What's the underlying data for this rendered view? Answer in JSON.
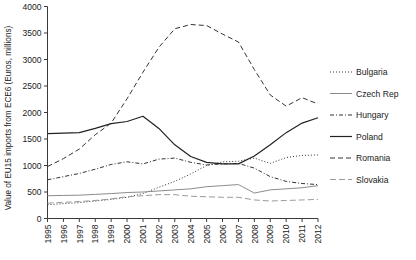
{
  "chart_data": {
    "type": "line",
    "title": "",
    "xlabel": "",
    "ylabel": "Value of EU15 imports from ECE6 (Euros, millions)",
    "x": [
      1995,
      1996,
      1997,
      1998,
      1999,
      2000,
      2001,
      2002,
      2003,
      2004,
      2005,
      2006,
      2007,
      2008,
      2009,
      2010,
      2011,
      2012
    ],
    "xtick_labels": [
      "1995",
      "1996",
      "1997",
      "1998",
      "1999",
      "2000",
      "2001",
      "2002",
      "2003",
      "2004",
      "2005",
      "2006",
      "2007",
      "2008",
      "2009",
      "2010",
      "2011",
      "2012"
    ],
    "ytick_labels": [
      "0",
      "500",
      "1000",
      "1500",
      "2000",
      "2500",
      "3000",
      "3500",
      "4000"
    ],
    "yticks": [
      0,
      500,
      1000,
      1500,
      2000,
      2500,
      3000,
      3500,
      4000
    ],
    "ylim": [
      0,
      4000
    ],
    "xlim": [
      1995,
      2012
    ],
    "grid": false,
    "legend_position": "right",
    "series": [
      {
        "name": "Bulgaria",
        "dash": "1,2",
        "width": 1.0,
        "color": "#333333",
        "values": [
          260,
          280,
          300,
          330,
          360,
          400,
          470,
          590,
          700,
          840,
          1000,
          1070,
          1080,
          1140,
          1040,
          1150,
          1190,
          1200
        ]
      },
      {
        "name": "Czech Rep",
        "dash": "none",
        "width": 1.0,
        "color": "#8c8c8c",
        "values": [
          430,
          435,
          440,
          455,
          470,
          490,
          500,
          520,
          540,
          560,
          600,
          620,
          640,
          480,
          540,
          560,
          580,
          620
        ]
      },
      {
        "name": "Hungary",
        "dash": "4,2,1,2",
        "width": 1.0,
        "color": "#333333",
        "values": [
          730,
          790,
          850,
          930,
          1020,
          1070,
          1030,
          1120,
          1140,
          1060,
          1010,
          1030,
          1040,
          950,
          790,
          700,
          660,
          640
        ]
      },
      {
        "name": "Poland",
        "dash": "none",
        "width": 1.2,
        "color": "#222222",
        "values": [
          1600,
          1610,
          1620,
          1700,
          1790,
          1830,
          1930,
          1700,
          1390,
          1170,
          1060,
          1030,
          1030,
          1180,
          1390,
          1620,
          1800,
          1900
        ]
      },
      {
        "name": "Romania",
        "dash": "5,3",
        "width": 1.0,
        "color": "#333333",
        "values": [
          980,
          1130,
          1310,
          1580,
          1800,
          2260,
          2760,
          3230,
          3580,
          3660,
          3640,
          3480,
          3330,
          2810,
          2330,
          2120,
          2280,
          2160
        ]
      },
      {
        "name": "Slovakia",
        "dash": "6,3",
        "width": 1.0,
        "color": "#9a9a9a",
        "values": [
          290,
          305,
          320,
          340,
          370,
          410,
          430,
          450,
          450,
          420,
          410,
          400,
          400,
          350,
          330,
          340,
          350,
          360
        ]
      }
    ]
  },
  "legend": {
    "items": [
      {
        "label": "Bulgaria"
      },
      {
        "label": "Czech Rep"
      },
      {
        "label": "Hungary"
      },
      {
        "label": "Poland"
      },
      {
        "label": "Romania"
      },
      {
        "label": "Slovakia"
      }
    ]
  }
}
